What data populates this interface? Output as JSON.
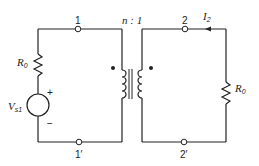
{
  "diagram": {
    "type": "ideal transformer circuit",
    "turns_ratio": {
      "label": "n : 1"
    },
    "nodes": [
      {
        "id": "node-1",
        "label": "1"
      },
      {
        "id": "node-1p",
        "label": "1′"
      },
      {
        "id": "node-2",
        "label": "2"
      },
      {
        "id": "node-2p",
        "label": "2′"
      }
    ],
    "components": {
      "source_resistor": {
        "symbol": "R",
        "subscript": "0"
      },
      "voltage_source": {
        "symbol": "V",
        "subscript": "s1",
        "plus": "+",
        "minus": "−"
      },
      "load_resistor": {
        "symbol": "R",
        "subscript": "0"
      },
      "current": {
        "symbol": "I",
        "subscript": "2"
      }
    },
    "colors": {
      "line": "#222222",
      "background": "#ffffff"
    }
  }
}
